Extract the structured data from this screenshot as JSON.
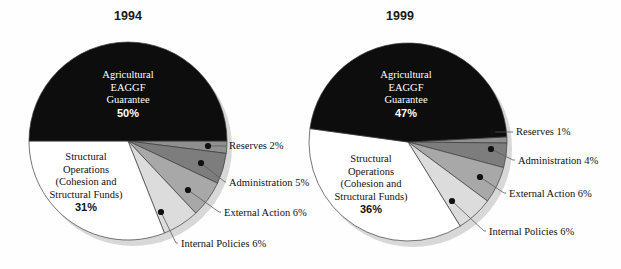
{
  "figure": {
    "background": "#fefefe",
    "width": 621,
    "height": 269
  },
  "palette": {
    "agricultural": "#0d0d0d",
    "structural": "#ffffff",
    "internal_policies": "#dcdcdc",
    "external_action": "#a8a8a8",
    "administration": "#7d7d7d",
    "reserves": "#8f8f8f",
    "outline": "#3c3c3c",
    "shadow": "#d8d8d8",
    "text": "#111111",
    "text_inverse": "#ffffff",
    "leader_line": "#5a5a5a"
  },
  "charts": [
    {
      "id": "chart-1994",
      "title": "1994",
      "center": {
        "x": 128,
        "y": 141
      },
      "radius": 99,
      "title_pos": {
        "x": 128,
        "y": 20
      },
      "inner_labels": [
        {
          "name": "agricultural",
          "lines": [
            "Agricultural",
            "EAGGF",
            "Guarantee"
          ],
          "percent": "50%",
          "x": 128,
          "y": 78,
          "inverse": true
        },
        {
          "name": "structural",
          "lines": [
            "Structural",
            "Operations",
            "(Cohesion and",
            "Structural Funds)"
          ],
          "percent": "31%",
          "x": 86,
          "y": 160,
          "inverse": false
        }
      ],
      "callouts": [
        {
          "name": "reserves",
          "label": "Reserves 2%",
          "dot": {
            "x": 208,
            "y": 146
          },
          "elbow": {
            "x": 222,
            "y": 146
          },
          "text": {
            "x": 229,
            "y": 149
          }
        },
        {
          "name": "administration",
          "label": "Administration 5%",
          "dot": {
            "x": 201,
            "y": 163
          },
          "elbow": {
            "x": 225,
            "y": 182
          },
          "text": {
            "x": 229,
            "y": 186
          }
        },
        {
          "name": "external-action",
          "label": "External Action 6%",
          "dot": {
            "x": 188,
            "y": 190
          },
          "elbow": {
            "x": 219,
            "y": 212
          },
          "text": {
            "x": 224,
            "y": 216
          }
        },
        {
          "name": "internal-policies",
          "label": "Internal Policies 6%",
          "dot": {
            "x": 161,
            "y": 212
          },
          "elbow": {
            "x": 176,
            "y": 243
          },
          "text": {
            "x": 181,
            "y": 247
          }
        }
      ]
    },
    {
      "id": "chart-1999",
      "title": "1999",
      "center": {
        "x": 408,
        "y": 142
      },
      "radius": 99,
      "title_pos": {
        "x": 400,
        "y": 20
      },
      "inner_labels": [
        {
          "name": "agricultural",
          "lines": [
            "Agricultural",
            "EAGGF",
            "Guarantee"
          ],
          "percent": "47%",
          "x": 406,
          "y": 78,
          "inverse": true
        },
        {
          "name": "structural",
          "lines": [
            "Structural",
            "Operations",
            "(Cohesion and",
            "Structural Funds)"
          ],
          "percent": "36%",
          "x": 371,
          "y": 162,
          "inverse": false
        }
      ],
      "callouts": [
        {
          "name": "reserves",
          "label": "Reserves 1%",
          "dot": {
            "x": 492,
            "y": 132
          },
          "elbow": {
            "x": 510,
            "y": 132
          },
          "text": {
            "x": 516,
            "y": 135
          }
        },
        {
          "name": "administration",
          "label": "Administration 4%",
          "dot": {
            "x": 491,
            "y": 149
          },
          "elbow": {
            "x": 513,
            "y": 160
          },
          "text": {
            "x": 518,
            "y": 164
          }
        },
        {
          "name": "external-action",
          "label": "External Action 6%",
          "dot": {
            "x": 480,
            "y": 177
          },
          "elbow": {
            "x": 504,
            "y": 193
          },
          "text": {
            "x": 509,
            "y": 197
          }
        },
        {
          "name": "internal-policies",
          "label": "Internal Policies 6%",
          "dot": {
            "x": 452,
            "y": 201
          },
          "elbow": {
            "x": 484,
            "y": 231
          },
          "text": {
            "x": 489,
            "y": 235
          }
        }
      ]
    }
  ],
  "chart_data": [
    {
      "type": "pie",
      "title": "1994",
      "categories": [
        "Agricultural EAGGF Guarantee",
        "Structural Operations (Cohesion and Structural Funds)",
        "Internal Policies",
        "External Action",
        "Administration",
        "Reserves"
      ],
      "values": [
        50,
        31,
        6,
        6,
        5,
        2
      ],
      "value_labels": [
        "50%",
        "31%",
        "6%",
        "6%",
        "5%",
        "2%"
      ],
      "units": "percent",
      "colors": [
        "#0d0d0d",
        "#ffffff",
        "#dcdcdc",
        "#a8a8a8",
        "#7d7d7d",
        "#8f8f8f"
      ],
      "start_angle_deg": 0,
      "direction": "clockwise",
      "slice_order_clockwise_from_3oclock": [
        "Reserves",
        "Administration",
        "External Action",
        "Internal Policies",
        "Structural Operations (Cohesion and Structural Funds)",
        "Agricultural EAGGF Guarantee"
      ],
      "legend": "callout labels with leader lines",
      "xlabel": "",
      "ylabel": ""
    },
    {
      "type": "pie",
      "title": "1999",
      "categories": [
        "Agricultural EAGGF Guarantee",
        "Structural Operations (Cohesion and Structural Funds)",
        "Internal Policies",
        "External Action",
        "Administration",
        "Reserves"
      ],
      "values": [
        47,
        36,
        6,
        6,
        4,
        1
      ],
      "value_labels": [
        "47%",
        "36%",
        "6%",
        "6%",
        "4%",
        "1%"
      ],
      "units": "percent",
      "colors": [
        "#0d0d0d",
        "#ffffff",
        "#dcdcdc",
        "#a8a8a8",
        "#7d7d7d",
        "#8f8f8f"
      ],
      "start_angle_deg": -3,
      "direction": "clockwise",
      "slice_order_clockwise_from_3oclock": [
        "Reserves",
        "Administration",
        "External Action",
        "Internal Policies",
        "Structural Operations (Cohesion and Structural Funds)",
        "Agricultural EAGGF Guarantee"
      ],
      "legend": "callout labels with leader lines",
      "xlabel": "",
      "ylabel": ""
    }
  ]
}
